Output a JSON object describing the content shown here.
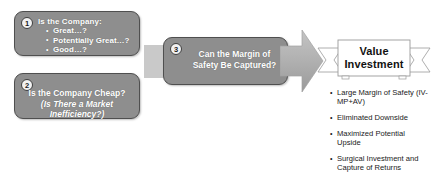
{
  "diagram": {
    "steps": [
      {
        "number": "1",
        "title": "Is the Company:",
        "bullets": [
          "Great…?",
          "Potentially Great…?",
          "Good…?"
        ]
      },
      {
        "number": "2",
        "line1": "Is the Company Cheap?",
        "line2": "(Is There a Market Inefficiency?)"
      },
      {
        "number": "3",
        "text": "Can the Margin of Safety Be Captured?"
      }
    ],
    "result": {
      "banner_label": "Value Investment",
      "outcomes": [
        "Large Margin of Safety (IV-MP+AV)",
        "Eliminated Downside",
        "Maximized Potential Upside",
        "Surgical Investment and Capture of Returns"
      ]
    },
    "colors": {
      "box_fill": "#8e8e8e",
      "box_border": "#4f4f4f",
      "arrow_fill": "#b3b3b3",
      "tail_fill": "#c9c9c9",
      "banner_fill": "#ffffff",
      "banner_stroke": "#9a9a9a",
      "text_light": "#ffffff",
      "text_dark": "#1a1a1a"
    }
  }
}
